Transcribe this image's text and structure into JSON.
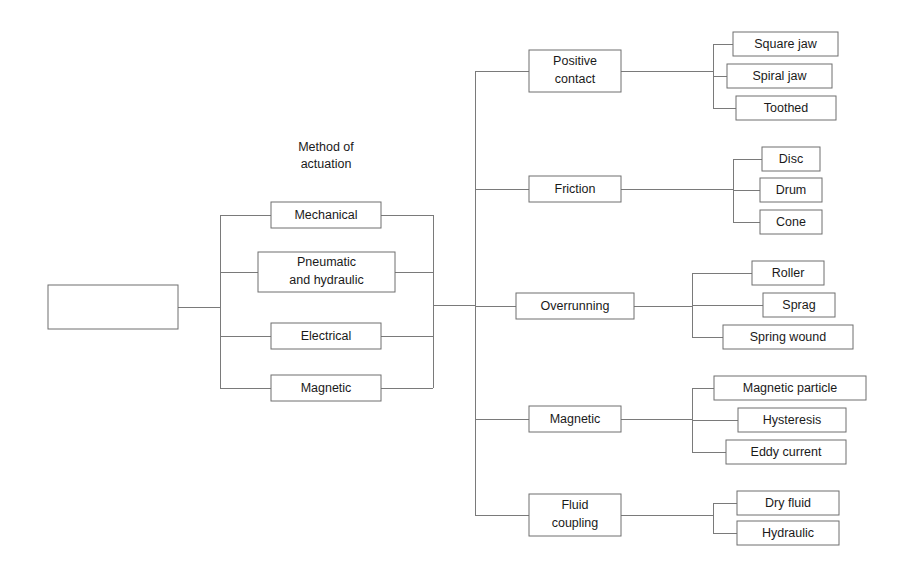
{
  "diagram": {
    "title_texts": [
      {
        "id": "actuation-heading",
        "line1": "Method of",
        "line2": "actuation",
        "x": 326,
        "y": 148
      }
    ],
    "root": {
      "label_line1": "Method of",
      "label_line2": "engagement",
      "x": 48,
      "y": 285,
      "w": 130,
      "h": 44
    },
    "actuation_nodes": [
      {
        "name": "mechanical",
        "line1": "Mechanical",
        "line2": "",
        "x": 271,
        "y": 202,
        "w": 110,
        "h": 26
      },
      {
        "name": "pneumatic-and-hydraulic",
        "line1": "Pneumatic",
        "line2": "and hydraulic",
        "x": 258,
        "y": 252,
        "w": 137,
        "h": 40
      },
      {
        "name": "electrical",
        "line1": "Electrical",
        "line2": "",
        "x": 271,
        "y": 323,
        "w": 110,
        "h": 26
      },
      {
        "name": "magnetic-actuation",
        "line1": "Magnetic",
        "line2": "",
        "x": 271,
        "y": 375,
        "w": 110,
        "h": 26
      }
    ],
    "type_nodes": [
      {
        "name": "positive-contact",
        "line1": "Positive",
        "line2": "contact",
        "x": 529,
        "y": 50,
        "w": 92,
        "h": 42,
        "cy": 71
      },
      {
        "name": "friction",
        "line1": "Friction",
        "line2": "",
        "x": 529,
        "y": 176,
        "w": 92,
        "h": 26,
        "cy": 189
      },
      {
        "name": "overrunning",
        "line1": "Overrunning",
        "line2": "",
        "x": 516,
        "y": 293,
        "w": 118,
        "h": 26,
        "cy": 306
      },
      {
        "name": "magnetic-type",
        "line1": "Magnetic",
        "line2": "",
        "x": 529,
        "y": 406,
        "w": 92,
        "h": 26,
        "cy": 419
      },
      {
        "name": "fluid-coupling",
        "line1": "Fluid",
        "line2": "coupling",
        "x": 529,
        "y": 494,
        "w": 92,
        "h": 42,
        "cy": 515
      }
    ],
    "leaf_groups": [
      {
        "parent": "positive-contact",
        "spine_x": 713,
        "parent_cy": 71,
        "leaves": [
          {
            "name": "square-jaw",
            "label": "Square jaw",
            "x": 733,
            "y": 32,
            "w": 105,
            "h": 24
          },
          {
            "name": "spiral-jaw",
            "label": "Spiral jaw",
            "x": 727,
            "y": 64,
            "w": 105,
            "h": 24
          },
          {
            "name": "toothed",
            "label": "Toothed",
            "x": 736,
            "y": 96,
            "w": 100,
            "h": 24
          }
        ]
      },
      {
        "parent": "friction",
        "spine_x": 733,
        "parent_cy": 189,
        "leaves": [
          {
            "name": "disc",
            "label": "Disc",
            "x": 762,
            "y": 147,
            "w": 58,
            "h": 24
          },
          {
            "name": "drum",
            "label": "Drum",
            "x": 760,
            "y": 178,
            "w": 62,
            "h": 24
          },
          {
            "name": "cone",
            "label": "Cone",
            "x": 760,
            "y": 210,
            "w": 62,
            "h": 24
          }
        ]
      },
      {
        "parent": "overrunning",
        "spine_x": 692,
        "parent_cy": 306,
        "leaves": [
          {
            "name": "roller",
            "label": "Roller",
            "x": 752,
            "y": 261,
            "w": 72,
            "h": 24
          },
          {
            "name": "sprag",
            "label": "Sprag",
            "x": 763,
            "y": 293,
            "w": 72,
            "h": 24
          },
          {
            "name": "spring-wound",
            "label": "Spring wound",
            "x": 723,
            "y": 325,
            "w": 130,
            "h": 24
          }
        ]
      },
      {
        "parent": "magnetic-type",
        "spine_x": 692,
        "parent_cy": 419,
        "leaves": [
          {
            "name": "magnetic-particle",
            "label": "Magnetic particle",
            "x": 714,
            "y": 376,
            "w": 152,
            "h": 24
          },
          {
            "name": "hysteresis",
            "label": "Hysteresis",
            "x": 738,
            "y": 408,
            "w": 108,
            "h": 24
          },
          {
            "name": "eddy-current",
            "label": "Eddy current",
            "x": 726,
            "y": 440,
            "w": 120,
            "h": 24
          }
        ]
      },
      {
        "parent": "fluid-coupling",
        "spine_x": 713,
        "parent_cy": 515,
        "leaves": [
          {
            "name": "dry-fluid",
            "label": "Dry fluid",
            "x": 737,
            "y": 491,
            "w": 102,
            "h": 24
          },
          {
            "name": "hydraulic",
            "label": "Hydraulic",
            "x": 737,
            "y": 521,
            "w": 102,
            "h": 24
          }
        ]
      }
    ],
    "spines": {
      "actuation_left_x": 220,
      "actuation_right_x": 433,
      "type_spine_x": 475,
      "root_cy": 307,
      "trunk_y": 305
    },
    "colors": {
      "line": "#7a7a7a",
      "box_stroke": "#6f6f6f",
      "text": "#1a1a1a",
      "background": "#ffffff"
    }
  }
}
